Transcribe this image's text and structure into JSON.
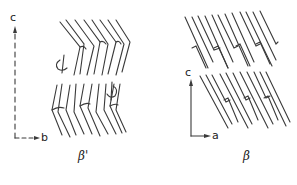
{
  "diagram": {
    "panels": [
      {
        "id": "beta-prime",
        "label": "β'",
        "axes": {
          "vertical": "c",
          "horizontal": "b",
          "style": "dashed"
        },
        "description": "Tilted chain packing with bent (chevron) hydrocarbon chains in two layers; rotation markers shown"
      },
      {
        "id": "beta",
        "label": "β",
        "axes": {
          "vertical": "c",
          "horizontal": "a",
          "style": "solid"
        },
        "description": "Parallel tilted chain packing in two layers with interlocking chain ends"
      }
    ],
    "colors": {
      "ink": "#333333",
      "background": "#ffffff"
    }
  }
}
